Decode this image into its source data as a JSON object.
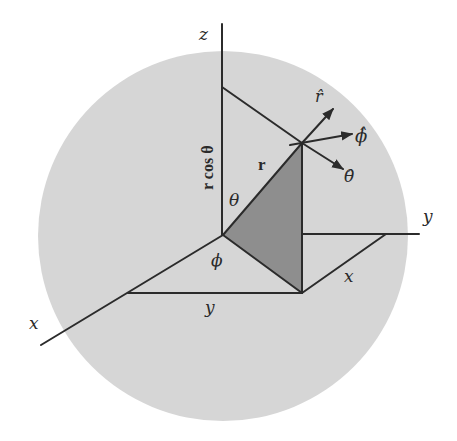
{
  "diagram": {
    "colors": {
      "sphere": "#d6d6d6",
      "shaded_triangle": "#8e8e8e",
      "lines": "#2b2b2b",
      "background": "#ffffff"
    },
    "axes": {
      "z": "z",
      "y": "y",
      "x": "x"
    },
    "labels": {
      "r_cos_theta": "r cos θ",
      "r_vector": "r",
      "theta": "θ",
      "phi": "ϕ",
      "y_length": "y",
      "x_length": "x"
    },
    "unit_vectors": {
      "r_hat": "r̂",
      "phi_hat": "ϕ̂",
      "theta_hat": "θ̂"
    }
  }
}
